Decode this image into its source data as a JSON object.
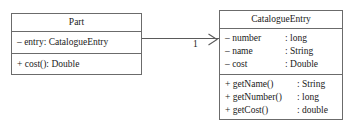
{
  "diagram": {
    "type": "uml-class-diagram",
    "background_color": "#ffffff",
    "line_color": "#6b6b6b",
    "text_color": "#1a1a1a"
  },
  "classes": [
    {
      "id": "part",
      "name": "Part",
      "attributes": [
        {
          "visibility": "–",
          "text": "– entry: CatalogueEntry"
        }
      ],
      "operations": [
        {
          "visibility": "+",
          "text": "+ cost(): Double"
        }
      ]
    },
    {
      "id": "catalogue-entry",
      "name": "CatalogueEntry",
      "attributes": [
        {
          "name": "– number",
          "type": ": long"
        },
        {
          "name": "– name",
          "type": ": String"
        },
        {
          "name": "– cost",
          "type": ": Double"
        }
      ],
      "operations": [
        {
          "name": "+ getName()",
          "type": ": String"
        },
        {
          "name": "+ getNumber()",
          "type": ": long"
        },
        {
          "name": "+ getCost()",
          "type": ": double"
        }
      ]
    }
  ],
  "association": {
    "source": "Part",
    "target": "CatalogueEntry",
    "target_multiplicity": "1",
    "arrow": "open-arrow-right",
    "arrow_icon": "open-arrowhead-icon"
  }
}
